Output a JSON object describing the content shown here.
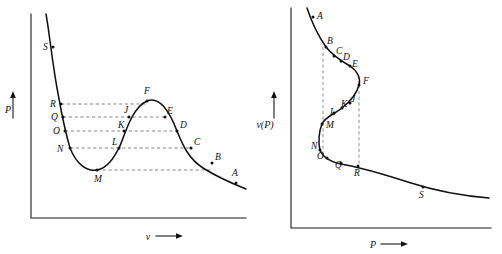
{
  "figure": {
    "background_color": "#ffffff",
    "curve_color": "#101010",
    "axis_color": "#1a1a1a",
    "dash_color": "#555555"
  },
  "panels": [
    {
      "id": "left",
      "name": "pressure-vs-volume",
      "axes": {
        "y_label": "P",
        "x_label": "v",
        "y_arrow": "up-arrow",
        "x_arrow": "right-arrow"
      },
      "points": [
        {
          "label": "S",
          "x": 53,
          "y": 47
        },
        {
          "label": "R",
          "x": 61,
          "y": 104
        },
        {
          "label": "Q",
          "x": 63,
          "y": 117
        },
        {
          "label": "O",
          "x": 65,
          "y": 131
        },
        {
          "label": "N",
          "x": 70,
          "y": 148
        },
        {
          "label": "M",
          "x": 97,
          "y": 170
        },
        {
          "label": "L",
          "x": 119,
          "y": 148
        },
        {
          "label": "K",
          "x": 124,
          "y": 131
        },
        {
          "label": "J",
          "x": 129,
          "y": 117
        },
        {
          "label": "F",
          "x": 147,
          "y": 101
        },
        {
          "label": "E",
          "x": 165,
          "y": 117
        },
        {
          "label": "D",
          "x": 177,
          "y": 131
        },
        {
          "label": "C",
          "x": 191,
          "y": 148
        },
        {
          "label": "B",
          "x": 212,
          "y": 163
        },
        {
          "label": "A",
          "x": 236,
          "y": 183
        }
      ],
      "tie_lines": [
        {
          "name": "tie-R-F",
          "y": 104,
          "x1": 61,
          "x2": 147
        },
        {
          "name": "tie-Q-E",
          "y": 117,
          "x1": 63,
          "x2": 165
        },
        {
          "name": "tie-O-D",
          "y": 131,
          "x1": 65,
          "x2": 177
        },
        {
          "name": "tie-N-C",
          "y": 148,
          "x1": 70,
          "x2": 191
        },
        {
          "name": "tie-M-B",
          "y": 170,
          "x1": 97,
          "x2": 212
        }
      ]
    },
    {
      "id": "right",
      "name": "volume-vs-pressure",
      "axes": {
        "y_label": "v(P)",
        "x_label": "P",
        "y_arrow": "up-arrow",
        "x_arrow": "right-arrow"
      },
      "points": [
        {
          "label": "A",
          "x": 62,
          "y": 17
        },
        {
          "label": "B",
          "x": 75,
          "y": 47
        },
        {
          "label": "C",
          "x": 83,
          "y": 56
        },
        {
          "label": "D",
          "x": 90,
          "y": 61
        },
        {
          "label": "E",
          "x": 99,
          "y": 66
        },
        {
          "label": "F",
          "x": 108,
          "y": 85
        },
        {
          "label": "J",
          "x": 99,
          "y": 103
        },
        {
          "label": "K",
          "x": 91,
          "y": 108
        },
        {
          "label": "L",
          "x": 83,
          "y": 113
        },
        {
          "label": "M",
          "x": 71,
          "y": 124
        },
        {
          "label": "N",
          "x": 69,
          "y": 150
        },
        {
          "label": "O",
          "x": 76,
          "y": 158
        },
        {
          "label": "Q",
          "x": 90,
          "y": 163
        },
        {
          "label": "R",
          "x": 107,
          "y": 166
        },
        {
          "label": "S",
          "x": 172,
          "y": 187
        }
      ],
      "drop_lines": [
        {
          "name": "drop-B-N",
          "x": 72,
          "y1": 47,
          "y2": 154
        },
        {
          "name": "drop-F-R",
          "x": 108,
          "y1": 85,
          "y2": 166
        }
      ]
    }
  ]
}
